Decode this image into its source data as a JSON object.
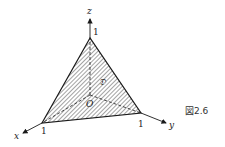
{
  "figure": {
    "caption": "図2.6",
    "region_label": "𝔇",
    "origin_label": "O",
    "axes": {
      "x": {
        "label": "x",
        "tick": "1"
      },
      "y": {
        "label": "y",
        "tick": "1"
      },
      "z": {
        "label": "z",
        "tick": "1"
      }
    },
    "colors": {
      "stroke": "#1a1a1a",
      "hatch": "#555555",
      "background": "#ffffff"
    }
  }
}
